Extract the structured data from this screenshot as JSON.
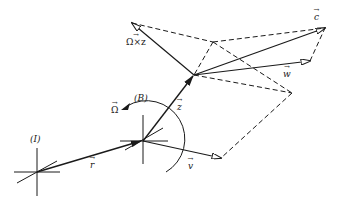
{
  "diagram": {
    "ink_color": "#1a1a1a",
    "frames": [
      {
        "id": "I",
        "label": "(I)"
      },
      {
        "id": "B",
        "label": "(B)"
      }
    ],
    "vectors": [
      {
        "id": "r",
        "label": "r"
      },
      {
        "id": "z",
        "label": "z"
      },
      {
        "id": "v",
        "label": "v"
      },
      {
        "id": "w",
        "label": "w"
      },
      {
        "id": "c",
        "label": "c"
      },
      {
        "id": "omega_cross_z",
        "label": "Ω×z"
      },
      {
        "id": "omega",
        "label": "Ω"
      }
    ]
  }
}
